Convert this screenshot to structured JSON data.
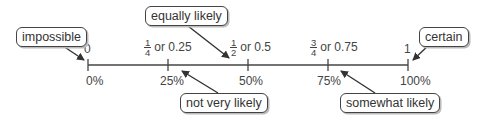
{
  "number_line": {
    "start_fraction": "0",
    "end_fraction": "1",
    "ticks": [
      {
        "position": 0,
        "top_label": "0",
        "fraction": null,
        "decimal": null,
        "percent": "0%"
      },
      {
        "position": 0.25,
        "top_label": null,
        "fraction": {
          "num": "1",
          "den": "4"
        },
        "decimal": "or 0.25",
        "percent": "25%"
      },
      {
        "position": 0.5,
        "top_label": null,
        "fraction": {
          "num": "1",
          "den": "2"
        },
        "decimal": "or 0.5",
        "percent": "50%"
      },
      {
        "position": 0.75,
        "top_label": null,
        "fraction": {
          "num": "3",
          "den": "4"
        },
        "decimal": "or 0.75",
        "percent": "75%"
      },
      {
        "position": 1,
        "top_label": "1",
        "fraction": null,
        "decimal": null,
        "percent": "100%"
      }
    ]
  },
  "callouts": {
    "impossible": "impossible",
    "equally_likely": "equally likely",
    "certain": "certain",
    "not_very_likely": "not very likely",
    "somewhat_likely": "somewhat likely"
  },
  "colors": {
    "line": "#444444",
    "text": "#333333",
    "box_border": "#444444",
    "shadow": "#bbbbbb"
  }
}
